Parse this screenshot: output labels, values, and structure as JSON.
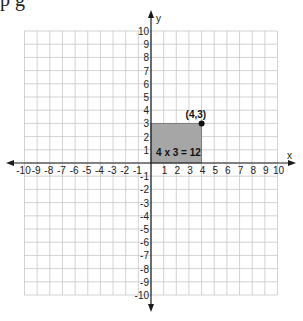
{
  "header": {
    "cropped_text": "p                    g"
  },
  "diagram": {
    "type": "coordinate-grid",
    "x_axis_label": "x",
    "y_axis_label": "y",
    "x_range": [
      -10,
      10
    ],
    "y_range": [
      -10,
      10
    ],
    "x_ticks": [
      "-10",
      "-9",
      "-8",
      "-7",
      "-6",
      "-5",
      "-4",
      "-3",
      "-2",
      "-1",
      "1",
      "2",
      "3",
      "4",
      "5",
      "6",
      "7",
      "8",
      "9",
      "10"
    ],
    "y_ticks_pos": [
      "1",
      "2",
      "3",
      "4",
      "5",
      "6",
      "7",
      "8",
      "9",
      "10"
    ],
    "y_ticks_neg": [
      "-1",
      "-2",
      "-3",
      "-4",
      "-5",
      "-6",
      "-7",
      "-8",
      "-9",
      "-10"
    ],
    "rectangle": {
      "x": [
        0,
        4
      ],
      "y": [
        0,
        3
      ],
      "fill": "#a6a6a6",
      "label": "4 x 3 = 12"
    },
    "point": {
      "x": 4,
      "y": 3,
      "label": "(4,3)"
    },
    "colors": {
      "grid": "#c8c8c8",
      "axis": "#1a1a1a",
      "shade": "#a6a6a6"
    }
  }
}
